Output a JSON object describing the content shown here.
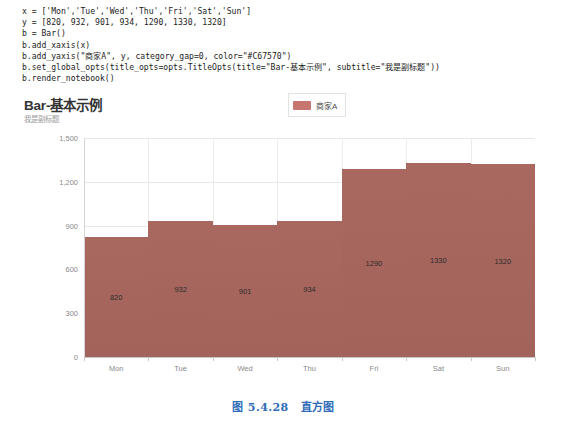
{
  "code": {
    "lines": [
      "x = ['Mon','Tue','Wed','Thu','Fri','Sat','Sun']",
      "y = [820, 932, 901, 934, 1290, 1330, 1320]",
      "b = Bar()",
      "b.add_xaxis(x)",
      "b.add_yaxis(\"商家A\", y, category_gap=0, color=\"#C67570\")",
      "b.set_global_opts(title_opts=opts.TitleOpts(title=\"Bar-基本示例\", subtitle=\"我是副标题\"))",
      "b.render_notebook()"
    ]
  },
  "chart": {
    "title": "Bar-基本示例",
    "subtitle": "我是副标题",
    "legend_label": "商家A",
    "bar_color": "#c67570",
    "bar_render_color": "#a2635c"
  },
  "chart_data": {
    "type": "bar",
    "title": "Bar-基本示例",
    "subtitle": "我是副标题",
    "categories": [
      "Mon",
      "Tue",
      "Wed",
      "Thu",
      "Fri",
      "Sat",
      "Sun"
    ],
    "series": [
      {
        "name": "商家A",
        "values": [
          820,
          932,
          901,
          934,
          1290,
          1330,
          1320
        ],
        "color": "#c67570"
      }
    ],
    "value_labels": [
      "820",
      "932",
      "901",
      "934",
      "1290",
      "1330",
      "1320"
    ],
    "xlabel": "",
    "ylabel": "",
    "ylim": [
      0,
      1500
    ],
    "yticks": [
      0,
      300,
      600,
      900,
      1200,
      1500
    ],
    "ytick_labels": [
      "0",
      "300",
      "600",
      "900",
      "1,200",
      "1,500"
    ],
    "grid": true,
    "category_gap": 0,
    "legend_position": "top-center"
  },
  "caption": {
    "number": "图 5.4.28",
    "text": "直方图"
  }
}
